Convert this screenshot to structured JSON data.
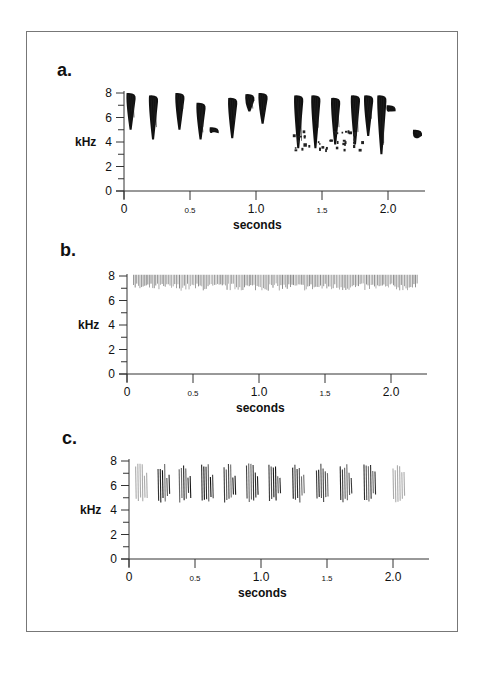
{
  "figure": {
    "panels": [
      {
        "label": "a.",
        "ylabel": "kHz",
        "xlabel": "seconds"
      },
      {
        "label": "b.",
        "ylabel": "kHz",
        "xlabel": "seconds"
      },
      {
        "label": "c.",
        "ylabel": "kHz",
        "xlabel": "seconds"
      }
    ]
  },
  "chart_data": [
    {
      "type": "heatmap",
      "title": "a.",
      "description": "Spectrogram of complex, varied song with multiple syllable types",
      "xlabel": "seconds",
      "ylabel": "kHz",
      "xlim": [
        0,
        2.25
      ],
      "ylim": [
        0,
        8
      ],
      "x_ticks": [
        "0",
        "0.5",
        "1.0",
        "1.5",
        "2.0"
      ],
      "y_ticks": [
        "0",
        "2",
        "4",
        "6",
        "8"
      ],
      "notes": "Irregular syllables spanning roughly 3-8 kHz from 0 to ~2.2 s",
      "syllables": [
        {
          "t": 0.05,
          "f_low": 5.0,
          "f_high": 8.0
        },
        {
          "t": 0.22,
          "f_low": 4.2,
          "f_high": 7.8
        },
        {
          "t": 0.42,
          "f_low": 5.0,
          "f_high": 8.0
        },
        {
          "t": 0.58,
          "f_low": 4.2,
          "f_high": 7.2
        },
        {
          "t": 0.68,
          "f_low": 4.8,
          "f_high": 5.2
        },
        {
          "t": 0.82,
          "f_low": 4.3,
          "f_high": 7.6
        },
        {
          "t": 0.95,
          "f_low": 6.5,
          "f_high": 7.9
        },
        {
          "t": 1.05,
          "f_low": 5.5,
          "f_high": 8.0
        },
        {
          "t": 1.32,
          "f_low": 3.5,
          "f_high": 7.8
        },
        {
          "t": 1.45,
          "f_low": 3.5,
          "f_high": 7.8
        },
        {
          "t": 1.6,
          "f_low": 3.8,
          "f_high": 7.6
        },
        {
          "t": 1.75,
          "f_low": 3.8,
          "f_high": 7.8
        },
        {
          "t": 1.85,
          "f_low": 4.5,
          "f_high": 7.8
        },
        {
          "t": 1.95,
          "f_low": 3.0,
          "f_high": 7.8
        },
        {
          "t": 2.02,
          "f_low": 6.5,
          "f_high": 7.0
        },
        {
          "t": 2.22,
          "f_low": 4.3,
          "f_high": 5.0
        }
      ]
    },
    {
      "type": "heatmap",
      "title": "b.",
      "description": "Spectrogram of rapid high-frequency trill",
      "xlabel": "seconds",
      "ylabel": "kHz",
      "xlim": [
        0,
        2.25
      ],
      "ylim": [
        0,
        8
      ],
      "x_ticks": [
        "0",
        "0.5",
        "1.0",
        "1.5",
        "2.0"
      ],
      "y_ticks": [
        "0",
        "2",
        "4",
        "6",
        "8"
      ],
      "notes": "Dense repeated downsweeps ~6.8-8 kHz from ~0.05 s to ~2.2 s",
      "band": {
        "t_start": 0.05,
        "t_end": 2.2,
        "f_low": 6.8,
        "f_high": 8.1
      }
    },
    {
      "type": "heatmap",
      "title": "c.",
      "description": "Spectrogram of repeated phrase song",
      "xlabel": "seconds",
      "ylabel": "kHz",
      "xlim": [
        0,
        2.25
      ],
      "ylim": [
        0,
        8
      ],
      "x_ticks": [
        "0",
        "0.5",
        "1.0",
        "1.5",
        "2.0"
      ],
      "y_ticks": [
        "0",
        "2",
        "4",
        "6",
        "8"
      ],
      "notes": "About 11 regularly spaced phrases, each ~4.5-7.8 kHz",
      "phrases_t": [
        0.05,
        0.22,
        0.38,
        0.55,
        0.72,
        0.89,
        1.06,
        1.24,
        1.42,
        1.6,
        1.78,
        2.0
      ],
      "f_low": 4.6,
      "f_high": 7.8
    }
  ]
}
